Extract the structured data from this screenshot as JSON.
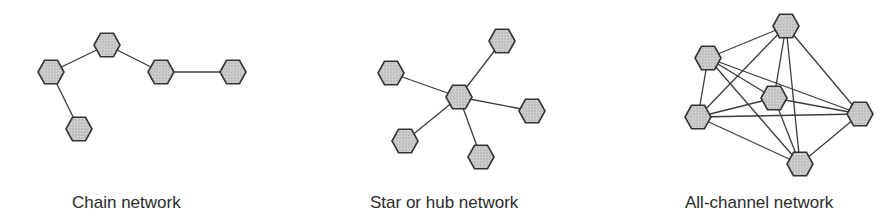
{
  "figure": {
    "node_shape": "hexagon",
    "node_fill": "#c6c6c6",
    "node_stroke": "#333333",
    "edge_color": "#3c3c3c",
    "node_radius": 13
  },
  "networks": [
    {
      "id": "chain",
      "label": "Chain network",
      "label_x": 72,
      "nodes": [
        {
          "id": "c1",
          "x": 51,
          "y": 72
        },
        {
          "id": "c2",
          "x": 107,
          "y": 45
        },
        {
          "id": "c3",
          "x": 161,
          "y": 72
        },
        {
          "id": "c4",
          "x": 233,
          "y": 72
        },
        {
          "id": "c5",
          "x": 79,
          "y": 129
        }
      ],
      "edges": [
        [
          "c1",
          "c2"
        ],
        [
          "c2",
          "c3"
        ],
        [
          "c3",
          "c4"
        ],
        [
          "c1",
          "c5"
        ]
      ]
    },
    {
      "id": "star",
      "label": "Star or hub network",
      "label_x": 370,
      "nodes": [
        {
          "id": "s0",
          "x": 459,
          "y": 97
        },
        {
          "id": "s1",
          "x": 502,
          "y": 41
        },
        {
          "id": "s2",
          "x": 391,
          "y": 73
        },
        {
          "id": "s3",
          "x": 532,
          "y": 111
        },
        {
          "id": "s4",
          "x": 405,
          "y": 141
        },
        {
          "id": "s5",
          "x": 481,
          "y": 157
        }
      ],
      "edges": [
        [
          "s0",
          "s1"
        ],
        [
          "s0",
          "s2"
        ],
        [
          "s0",
          "s3"
        ],
        [
          "s0",
          "s4"
        ],
        [
          "s0",
          "s5"
        ]
      ]
    },
    {
      "id": "all-channel",
      "label": "All-channel network",
      "label_x": 685,
      "nodes": [
        {
          "id": "a1",
          "x": 786,
          "y": 26
        },
        {
          "id": "a2",
          "x": 708,
          "y": 58
        },
        {
          "id": "a3",
          "x": 774,
          "y": 98
        },
        {
          "id": "a4",
          "x": 698,
          "y": 117
        },
        {
          "id": "a5",
          "x": 860,
          "y": 114
        },
        {
          "id": "a6",
          "x": 800,
          "y": 164
        }
      ],
      "edges": [
        [
          "a1",
          "a2"
        ],
        [
          "a1",
          "a3"
        ],
        [
          "a1",
          "a4"
        ],
        [
          "a1",
          "a5"
        ],
        [
          "a1",
          "a6"
        ],
        [
          "a2",
          "a3"
        ],
        [
          "a2",
          "a4"
        ],
        [
          "a2",
          "a5"
        ],
        [
          "a2",
          "a6"
        ],
        [
          "a3",
          "a4"
        ],
        [
          "a3",
          "a5"
        ],
        [
          "a3",
          "a6"
        ],
        [
          "a4",
          "a5"
        ],
        [
          "a4",
          "a6"
        ],
        [
          "a5",
          "a6"
        ]
      ]
    }
  ]
}
